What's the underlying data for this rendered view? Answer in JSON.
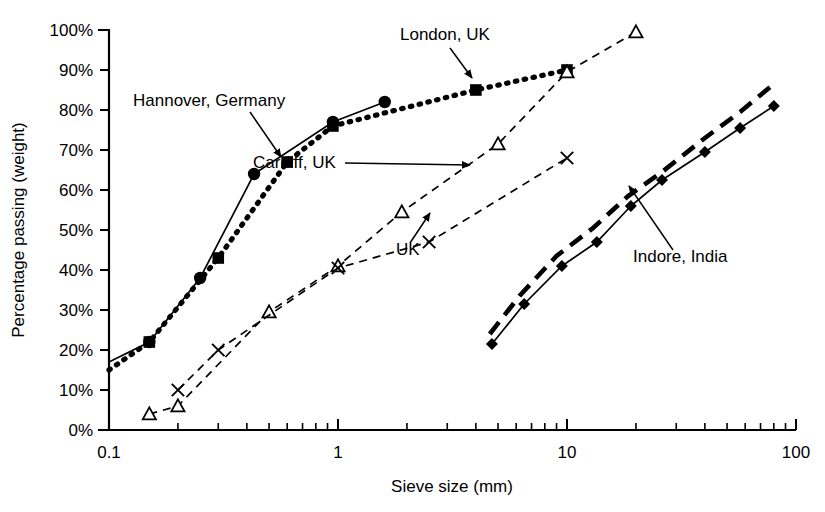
{
  "chart_data": {
    "type": "line",
    "title": "",
    "xlabel": "Sieve size (mm)",
    "ylabel": "Percentage passing (weight)",
    "xscale": "log",
    "xlim": [
      0.1,
      100
    ],
    "ylim": [
      0,
      100
    ],
    "xticks": [
      "0.1",
      "1",
      "10",
      "100"
    ],
    "xtick_values": [
      0.1,
      1,
      10,
      100
    ],
    "yticks": [
      "0%",
      "10%",
      "20%",
      "30%",
      "40%",
      "50%",
      "60%",
      "70%",
      "80%",
      "90%",
      "100%"
    ],
    "ytick_values": [
      0,
      10,
      20,
      30,
      40,
      50,
      60,
      70,
      80,
      90,
      100
    ],
    "grid": false,
    "legend": "inline-annotations",
    "series": [
      {
        "name": "Hannover, Germany",
        "marker": "filled-circle",
        "line": "solid",
        "points": [
          {
            "x": 0.1,
            "y": 17
          },
          {
            "x": 0.15,
            "y": 22
          },
          {
            "x": 0.25,
            "y": 38
          },
          {
            "x": 0.43,
            "y": 64
          },
          {
            "x": 0.95,
            "y": 77
          },
          {
            "x": 1.6,
            "y": 82
          }
        ]
      },
      {
        "name": "London, UK",
        "marker": "filled-square",
        "line": "dotted",
        "points": [
          {
            "x": 0.1,
            "y": 15
          },
          {
            "x": 0.15,
            "y": 22
          },
          {
            "x": 0.3,
            "y": 43
          },
          {
            "x": 0.6,
            "y": 67
          },
          {
            "x": 0.95,
            "y": 76
          },
          {
            "x": 4.0,
            "y": 85
          },
          {
            "x": 10.0,
            "y": 90
          }
        ]
      },
      {
        "name": "Cardiff, UK",
        "marker": "open-triangle",
        "line": "dashed",
        "points": [
          {
            "x": 0.15,
            "y": 4
          },
          {
            "x": 0.2,
            "y": 6
          },
          {
            "x": 0.5,
            "y": 29.5
          },
          {
            "x": 1.0,
            "y": 41
          },
          {
            "x": 1.9,
            "y": 54.5
          },
          {
            "x": 5.0,
            "y": 71.5
          },
          {
            "x": 10.0,
            "y": 89.5
          },
          {
            "x": 20.0,
            "y": 99.5
          }
        ]
      },
      {
        "name": "UK",
        "marker": "cross",
        "line": "dashed",
        "points": [
          {
            "x": 0.2,
            "y": 10
          },
          {
            "x": 0.3,
            "y": 20
          },
          {
            "x": 1.0,
            "y": 40.5
          },
          {
            "x": 2.5,
            "y": 47
          },
          {
            "x": 10.0,
            "y": 68
          }
        ]
      },
      {
        "name": "Indore, India",
        "marker": "filled-diamond",
        "line": "solid",
        "points": [
          {
            "x": 4.7,
            "y": 21.5
          },
          {
            "x": 6.5,
            "y": 31.5
          },
          {
            "x": 9.5,
            "y": 41
          },
          {
            "x": 13.5,
            "y": 47
          },
          {
            "x": 19.0,
            "y": 56
          },
          {
            "x": 26.0,
            "y": 62.5
          },
          {
            "x": 40.0,
            "y": 69.5
          },
          {
            "x": 57.0,
            "y": 75.5
          },
          {
            "x": 80.0,
            "y": 81
          }
        ]
      },
      {
        "name": "Indore, India (upper band)",
        "marker": "none",
        "line": "long-dashed",
        "points": [
          {
            "x": 4.6,
            "y": 24.0
          },
          {
            "x": 6.2,
            "y": 33.5
          },
          {
            "x": 9.0,
            "y": 43.5
          },
          {
            "x": 13.0,
            "y": 50.5
          },
          {
            "x": 18.5,
            "y": 58.5
          },
          {
            "x": 26.0,
            "y": 64.5
          },
          {
            "x": 40.0,
            "y": 73.0
          },
          {
            "x": 57.0,
            "y": 79.5
          },
          {
            "x": 80.0,
            "y": 86.5
          }
        ]
      }
    ],
    "annotations": [
      {
        "text": "Hannover, Germany",
        "text_x": 133,
        "text_y": 106,
        "arrow_from_x": 250,
        "arrow_from_y": 112,
        "arrow_to_x": 281,
        "arrow_to_y": 157
      },
      {
        "text": "London, UK",
        "text_x": 400,
        "text_y": 40,
        "arrow_from_x": 450,
        "arrow_from_y": 48,
        "arrow_to_x": 472,
        "arrow_to_y": 78
      },
      {
        "text": "Cardiff, UK",
        "text_x": 253,
        "text_y": 168,
        "arrow_from_x": 345,
        "arrow_from_y": 163,
        "arrow_to_x": 470,
        "arrow_to_y": 165
      },
      {
        "text": "UK",
        "text_x": 396,
        "text_y": 255,
        "arrow_from_x": 410,
        "arrow_from_y": 243,
        "arrow_to_x": 430,
        "arrow_to_y": 213
      },
      {
        "text": "Indore, India",
        "text_x": 633,
        "text_y": 262,
        "arrow_from_x": 673,
        "arrow_from_y": 250,
        "arrow_to_x": 629,
        "arrow_to_y": 186
      }
    ]
  },
  "axes": {
    "x_label": "Sieve size (mm)",
    "y_label": "Percentage passing (weight)",
    "x_tick_labels": [
      "0.1",
      "1",
      "10",
      "100"
    ],
    "y_tick_labels": [
      "0%",
      "10%",
      "20%",
      "30%",
      "40%",
      "50%",
      "60%",
      "70%",
      "80%",
      "90%",
      "100%"
    ]
  },
  "colors": {
    "axis": "#000000",
    "line": "#000000",
    "background": "#ffffff",
    "text": "#000000"
  }
}
